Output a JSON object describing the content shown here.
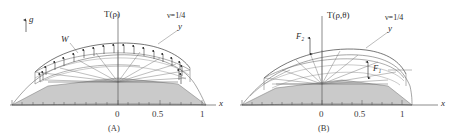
{
  "figure": {
    "background_color": "#ffffff",
    "line_color": "#4a4a4a",
    "fill_color": "#cccccc",
    "axis_color": "#555555"
  },
  "panels": [
    {
      "id": "A",
      "caption": "(A)",
      "vertical_axis_label": "T(ρ)",
      "horizontal_axis_label": "x",
      "surface_label": "y",
      "poisson_label": "ν=1/4",
      "gravity_label": "g",
      "load_label": "W",
      "x_ticks": [
        "0",
        "0.5",
        "1"
      ],
      "tick_values": [
        0,
        0.5,
        1
      ],
      "minor_tick_count": 20,
      "arrow_count": 14,
      "has_gravity_arrow": true,
      "has_load_arrows": true
    },
    {
      "id": "B",
      "caption": "(B)",
      "vertical_axis_label": "T(ρ,θ)",
      "horizontal_axis_label": "x",
      "surface_label": "y",
      "poisson_label": "ν=1/4",
      "force_labels": [
        "F₂",
        "F₁"
      ],
      "x_ticks": [
        "0",
        "0.5",
        "1"
      ],
      "tick_values": [
        0,
        0.5,
        1
      ],
      "minor_tick_count": 20,
      "has_gravity_arrow": false,
      "has_load_arrows": false
    }
  ]
}
